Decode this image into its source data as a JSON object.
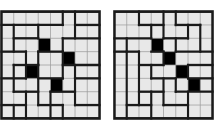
{
  "figure": {
    "background_color": "#ffffff",
    "cell_fill_color": "#e8e8e8",
    "blocked_cell_color": "#000000",
    "grid_line_color": "#9a9a9a",
    "tile_border_color": "#1a1a1a",
    "grid_columns": 8,
    "grid_rows": 8,
    "cell_size_px": 12.6
  },
  "puzzles": [
    {
      "id": "puzzle-left",
      "label": "Left grid",
      "columns": 8,
      "rows": 8,
      "blocked_cells": [
        {
          "col": 3,
          "row": 2
        },
        {
          "col": 5,
          "row": 3
        },
        {
          "col": 2,
          "row": 4
        },
        {
          "col": 4,
          "row": 5
        }
      ],
      "tile_edges_horizontal": [
        {
          "row": 1,
          "from_col": 0,
          "to_col": 5
        },
        {
          "row": 1,
          "from_col": 6,
          "to_col": 8
        },
        {
          "row": 2,
          "from_col": 1,
          "to_col": 3
        },
        {
          "row": 2,
          "from_col": 5,
          "to_col": 8
        },
        {
          "row": 3,
          "from_col": 0,
          "to_col": 2
        },
        {
          "row": 3,
          "from_col": 3,
          "to_col": 5
        },
        {
          "row": 4,
          "from_col": 1,
          "to_col": 3
        },
        {
          "row": 4,
          "from_col": 5,
          "to_col": 8
        },
        {
          "row": 5,
          "from_col": 0,
          "to_col": 2
        },
        {
          "row": 5,
          "from_col": 3,
          "to_col": 5
        },
        {
          "row": 5,
          "from_col": 6,
          "to_col": 8
        },
        {
          "row": 6,
          "from_col": 1,
          "to_col": 3
        },
        {
          "row": 6,
          "from_col": 4,
          "to_col": 6
        },
        {
          "row": 7,
          "from_col": 0,
          "to_col": 2
        },
        {
          "row": 7,
          "from_col": 3,
          "to_col": 5
        },
        {
          "row": 7,
          "from_col": 6,
          "to_col": 8
        }
      ],
      "tile_edges_vertical": [
        {
          "col": 5,
          "from_row": 0,
          "to_row": 1
        },
        {
          "col": 6,
          "from_row": 0,
          "to_row": 2
        },
        {
          "col": 1,
          "from_row": 1,
          "to_row": 3
        },
        {
          "col": 3,
          "from_row": 1,
          "to_row": 2
        },
        {
          "col": 5,
          "from_row": 2,
          "to_row": 3
        },
        {
          "col": 3,
          "from_row": 3,
          "to_row": 4
        },
        {
          "col": 2,
          "from_row": 3,
          "to_row": 5
        },
        {
          "col": 5,
          "from_row": 3,
          "to_row": 5
        },
        {
          "col": 1,
          "from_row": 4,
          "to_row": 6
        },
        {
          "col": 3,
          "from_row": 4,
          "to_row": 7
        },
        {
          "col": 6,
          "from_row": 4,
          "to_row": 5
        },
        {
          "col": 2,
          "from_row": 6,
          "to_row": 8
        },
        {
          "col": 6,
          "from_row": 5,
          "to_row": 7
        },
        {
          "col": 4,
          "from_row": 6,
          "to_row": 8
        },
        {
          "col": 5,
          "from_row": 7,
          "to_row": 8
        },
        {
          "col": 1,
          "from_row": 7,
          "to_row": 8
        }
      ]
    },
    {
      "id": "puzzle-right",
      "label": "Right grid",
      "columns": 8,
      "rows": 8,
      "blocked_cells": [
        {
          "col": 3,
          "row": 2
        },
        {
          "col": 4,
          "row": 3
        },
        {
          "col": 5,
          "row": 4
        },
        {
          "col": 6,
          "row": 5
        }
      ],
      "tile_edges_horizontal": [
        {
          "row": 1,
          "from_col": 2,
          "to_col": 4
        },
        {
          "row": 1,
          "from_col": 5,
          "to_col": 7
        },
        {
          "row": 2,
          "from_col": 0,
          "to_col": 3
        },
        {
          "row": 2,
          "from_col": 4,
          "to_col": 6
        },
        {
          "row": 3,
          "from_col": 0,
          "to_col": 2
        },
        {
          "row": 3,
          "from_col": 5,
          "to_col": 8
        },
        {
          "row": 3,
          "from_col": 3,
          "to_col": 4
        },
        {
          "row": 4,
          "from_col": 2,
          "to_col": 4
        },
        {
          "row": 4,
          "from_col": 6,
          "to_col": 8
        },
        {
          "row": 5,
          "from_col": 3,
          "to_col": 5
        },
        {
          "row": 5,
          "from_col": 6,
          "to_col": 8
        },
        {
          "row": 6,
          "from_col": 2,
          "to_col": 4
        },
        {
          "row": 6,
          "from_col": 5,
          "to_col": 8
        },
        {
          "row": 7,
          "from_col": 1,
          "to_col": 3
        },
        {
          "row": 7,
          "from_col": 4,
          "to_col": 6
        }
      ],
      "tile_edges_vertical": [
        {
          "col": 2,
          "from_row": 0,
          "to_row": 1
        },
        {
          "col": 4,
          "from_row": 0,
          "to_row": 2
        },
        {
          "col": 5,
          "from_row": 0,
          "to_row": 1
        },
        {
          "col": 7,
          "from_row": 1,
          "to_row": 3
        },
        {
          "col": 6,
          "from_row": 1,
          "to_row": 2
        },
        {
          "col": 3,
          "from_row": 1,
          "to_row": 2
        },
        {
          "col": 1,
          "from_row": 2,
          "to_row": 3
        },
        {
          "col": 5,
          "from_row": 2,
          "to_row": 3
        },
        {
          "col": 2,
          "from_row": 3,
          "to_row": 7
        },
        {
          "col": 4,
          "from_row": 3,
          "to_row": 4
        },
        {
          "col": 3,
          "from_row": 4,
          "to_row": 5
        },
        {
          "col": 6,
          "from_row": 4,
          "to_row": 5
        },
        {
          "col": 5,
          "from_row": 5,
          "to_row": 6
        },
        {
          "col": 4,
          "from_row": 5,
          "to_row": 7
        },
        {
          "col": 1,
          "from_row": 3,
          "to_row": 8
        },
        {
          "col": 3,
          "from_row": 6,
          "to_row": 8
        },
        {
          "col": 6,
          "from_row": 6,
          "to_row": 8
        }
      ]
    }
  ]
}
